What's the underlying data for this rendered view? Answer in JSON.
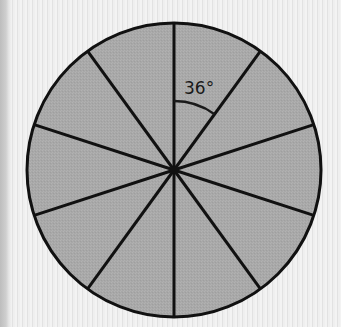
{
  "diagram": {
    "center": {
      "x": 174,
      "y": 170
    },
    "radius": 147,
    "sector_count": 10,
    "sector_angle_deg": 36,
    "angle_label": "36°",
    "angle_arc_radius": 69,
    "colors": {
      "fill": "#a9a9a9",
      "stroke": "#111111",
      "background": "#ececec"
    }
  }
}
